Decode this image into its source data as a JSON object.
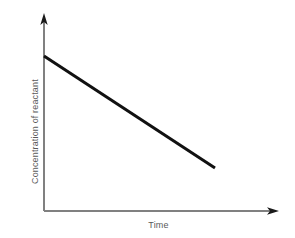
{
  "chart_data": {
    "type": "line",
    "title": "",
    "subtitle": "",
    "xlabel": "Time",
    "ylabel": "Concentration of reactant",
    "xlim": [
      0,
      1
    ],
    "ylim": [
      0,
      1
    ],
    "grid": false,
    "legend": null,
    "xticks": [],
    "yticks": [],
    "xticklabels": [],
    "yticklabels": [],
    "annotations": [],
    "series": [
      {
        "name": "Concentration of reactant vs time",
        "style": "solid",
        "color": "#111111",
        "linewidth": 3,
        "x": [
          0.0,
          0.25,
          0.5,
          0.73
        ],
        "y": [
          0.79,
          0.64,
          0.49,
          0.36
        ],
        "points_px": [
          [
            44,
            56
          ],
          [
            215,
            168
          ]
        ],
        "description": "Straight line with constant negative slope, starting high on the vertical axis and decreasing linearly; it stops before reaching the horizontal axis."
      }
    ]
  },
  "figure": {
    "background_color": "#ffffff",
    "axis_color": "#808080",
    "axis_linewidth": 1,
    "line_color": "#111111",
    "label_color": "#595959",
    "axis_arrowheads": true,
    "axes": {
      "y_axis": {
        "x": 44,
        "y_top": 14,
        "y_bottom": 211
      },
      "x_axis": {
        "y": 211,
        "x_left": 44,
        "x_right": 278
      }
    }
  },
  "labels": {
    "x_axis_title": "Time",
    "y_axis_title": "Concentration of reactant"
  },
  "icons": {
    "y_axis_arrow": "arrow-up-icon",
    "x_axis_arrow": "arrow-right-icon"
  }
}
